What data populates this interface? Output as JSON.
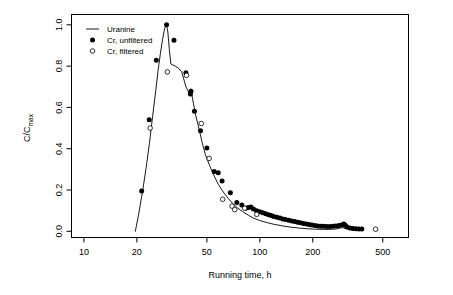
{
  "chart_data": {
    "type": "scatter",
    "title": "",
    "xlabel": "Running time, h",
    "ylabel": "C/Cmax",
    "ylabel_base": "C/C",
    "ylabel_sub": "max",
    "xscale": "log",
    "yscale": "linear",
    "xlim": [
      8.5,
      700
    ],
    "ylim": [
      -0.03,
      1.05
    ],
    "xticks": [
      10,
      20,
      50,
      100,
      200,
      500
    ],
    "xticklabels": [
      "10",
      "20",
      "50",
      "100",
      "200",
      "500"
    ],
    "yticks": [
      0.0,
      0.2,
      0.4,
      0.6,
      0.8,
      1.0
    ],
    "yticklabels": [
      "0.0",
      "0.2",
      "0.4",
      "0.6",
      "0.8",
      "1.0"
    ],
    "grid": false,
    "legend_position": "top-left",
    "legend": [
      {
        "label": "Uranine",
        "marker": "line"
      },
      {
        "label": "Cr, unfiltered",
        "marker": "filled-circle"
      },
      {
        "label": "Cr, filtered",
        "marker": "open-circle"
      }
    ],
    "series": [
      {
        "name": "Uranine",
        "marker": "line",
        "points": [
          [
            19.6,
            0.0
          ],
          [
            20.5,
            0.085
          ],
          [
            21.6,
            0.2
          ],
          [
            22.6,
            0.31
          ],
          [
            23.6,
            0.43
          ],
          [
            24.6,
            0.56
          ],
          [
            25.6,
            0.68
          ],
          [
            26.4,
            0.78
          ],
          [
            27.2,
            0.86
          ],
          [
            28.0,
            0.93
          ],
          [
            28.8,
            0.985
          ],
          [
            29.5,
            1.0
          ],
          [
            30.0,
            0.965
          ],
          [
            30.6,
            0.88
          ],
          [
            31.2,
            0.81
          ],
          [
            33.0,
            0.8
          ],
          [
            34.5,
            0.79
          ],
          [
            36.0,
            0.772
          ],
          [
            38.0,
            0.7
          ],
          [
            39.5,
            0.672
          ],
          [
            40.5,
            0.69
          ],
          [
            41.5,
            0.64
          ],
          [
            43.0,
            0.57
          ],
          [
            45.0,
            0.5
          ],
          [
            47.0,
            0.43
          ],
          [
            49.0,
            0.372
          ],
          [
            52.0,
            0.315
          ],
          [
            55.0,
            0.268
          ],
          [
            58.0,
            0.228
          ],
          [
            62.0,
            0.19
          ],
          [
            66.0,
            0.16
          ],
          [
            70.0,
            0.135
          ],
          [
            75.0,
            0.112
          ],
          [
            80.0,
            0.095
          ],
          [
            86.0,
            0.078
          ],
          [
            92.0,
            0.064
          ],
          [
            100.0,
            0.052
          ],
          [
            110.0,
            0.042
          ],
          [
            120.0,
            0.034
          ],
          [
            135.0,
            0.026
          ],
          [
            150.0,
            0.02
          ],
          [
            170.0,
            0.015
          ],
          [
            190.0,
            0.012
          ],
          [
            210.0,
            0.01
          ],
          [
            240.0,
            0.009
          ],
          [
            270.0,
            0.011
          ],
          [
            295.0,
            0.018
          ],
          [
            310.0,
            0.012
          ],
          [
            340.0,
            0.008
          ],
          [
            370.0,
            0.008
          ]
        ]
      },
      {
        "name": "Cr, unfiltered",
        "marker": "filled-circle",
        "points": [
          [
            21.3,
            0.195
          ],
          [
            23.5,
            0.54
          ],
          [
            25.8,
            0.828
          ],
          [
            29.5,
            1.0
          ],
          [
            32.5,
            0.925
          ],
          [
            38.0,
            0.768
          ],
          [
            40.3,
            0.665
          ],
          [
            40.6,
            0.678
          ],
          [
            42.5,
            0.582
          ],
          [
            46.0,
            0.487
          ],
          [
            50.0,
            0.403
          ],
          [
            55.0,
            0.29
          ],
          [
            58.0,
            0.283
          ],
          [
            61.0,
            0.244
          ],
          [
            68.0,
            0.187
          ],
          [
            74.0,
            0.14
          ],
          [
            79.0,
            0.128
          ],
          [
            83.0,
            0.112
          ],
          [
            86.0,
            0.115
          ],
          [
            89.0,
            0.118
          ],
          [
            92.0,
            0.108
          ],
          [
            96.0,
            0.1
          ],
          [
            100.0,
            0.095
          ],
          [
            104.0,
            0.09
          ],
          [
            108.0,
            0.085
          ],
          [
            112.0,
            0.08
          ],
          [
            116.0,
            0.076
          ],
          [
            120.0,
            0.072
          ],
          [
            125.0,
            0.068
          ],
          [
            130.0,
            0.064
          ],
          [
            135.0,
            0.06
          ],
          [
            140.0,
            0.057
          ],
          [
            146.0,
            0.054
          ],
          [
            152.0,
            0.05
          ],
          [
            158.0,
            0.047
          ],
          [
            164.0,
            0.044
          ],
          [
            170.0,
            0.041
          ],
          [
            177.0,
            0.038
          ],
          [
            184.0,
            0.035
          ],
          [
            191.0,
            0.033
          ],
          [
            198.0,
            0.03
          ],
          [
            206.0,
            0.028
          ],
          [
            214.0,
            0.026
          ],
          [
            222.0,
            0.025
          ],
          [
            231.0,
            0.024
          ],
          [
            240.0,
            0.023
          ],
          [
            250.0,
            0.023
          ],
          [
            260.0,
            0.024
          ],
          [
            270.0,
            0.026
          ],
          [
            281.0,
            0.028
          ],
          [
            292.0,
            0.031
          ],
          [
            300.0,
            0.035
          ],
          [
            305.0,
            0.03
          ],
          [
            312.0,
            0.022
          ],
          [
            325.0,
            0.016
          ],
          [
            338.0,
            0.013
          ],
          [
            352.0,
            0.012
          ],
          [
            366.0,
            0.011
          ],
          [
            380.0,
            0.011
          ]
        ]
      },
      {
        "name": "Cr, filtered",
        "marker": "open-circle",
        "points": [
          [
            23.8,
            0.5
          ],
          [
            29.8,
            0.772
          ],
          [
            38.3,
            0.755
          ],
          [
            46.5,
            0.522
          ],
          [
            51.5,
            0.353
          ],
          [
            61.5,
            0.155
          ],
          [
            69.5,
            0.122
          ],
          [
            72.0,
            0.105
          ],
          [
            82.0,
            0.112
          ],
          [
            96.0,
            0.082
          ],
          [
            455.0,
            0.01
          ]
        ]
      }
    ]
  }
}
